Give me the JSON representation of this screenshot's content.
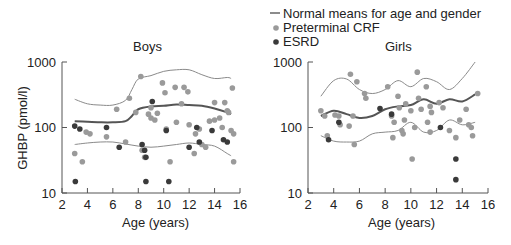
{
  "legend": {
    "items": [
      {
        "label": "Normal means for age and gender",
        "type": "line",
        "color": "#666666"
      },
      {
        "label": "Preterminal CRF",
        "type": "dot",
        "color": "#9a9a9a"
      },
      {
        "label": "ESRD",
        "type": "dot",
        "color": "#3a3a3a"
      }
    ]
  },
  "chart_data": [
    {
      "type": "scatter",
      "title": "Boys",
      "xlabel": "Age (years)",
      "ylabel": "GHBP (pmol/l)",
      "xlim": [
        2,
        16
      ],
      "ylim": [
        10,
        1000
      ],
      "yscale": "log",
      "xticks": [
        "2",
        "4",
        "6",
        "8",
        "10",
        "12",
        "14",
        "16"
      ],
      "yticks": [
        "10",
        "100",
        "1000"
      ],
      "grid": false,
      "series": [
        {
          "name": "Normal means for age and gender (mean)",
          "type": "line",
          "points": [
            [
              3,
              125
            ],
            [
              4,
              122
            ],
            [
              5,
              120
            ],
            [
              6,
              120
            ],
            [
              7,
              125
            ],
            [
              7.5,
              150
            ],
            [
              8,
              190
            ],
            [
              9,
              210
            ],
            [
              10,
              215
            ],
            [
              11,
              225
            ],
            [
              12,
              220
            ],
            [
              13,
              215
            ],
            [
              14,
              195
            ],
            [
              15,
              170
            ],
            [
              15.3,
              160
            ]
          ]
        },
        {
          "name": "Normal means for age and gender (upper)",
          "type": "line",
          "points": [
            [
              3,
              270
            ],
            [
              4,
              230
            ],
            [
              5,
              220
            ],
            [
              6,
              220
            ],
            [
              7,
              260
            ],
            [
              7.5,
              380
            ],
            [
              8,
              550
            ],
            [
              9,
              620
            ],
            [
              10,
              720
            ],
            [
              11,
              760
            ],
            [
              12,
              760
            ],
            [
              13,
              640
            ],
            [
              14,
              560
            ],
            [
              15,
              580
            ],
            [
              15.3,
              560
            ]
          ]
        },
        {
          "name": "Normal means for age and gender (lower)",
          "type": "line",
          "points": [
            [
              3,
              55
            ],
            [
              4,
              58
            ],
            [
              5,
              60
            ],
            [
              6,
              60
            ],
            [
              7,
              56
            ],
            [
              8,
              52
            ],
            [
              9,
              50
            ],
            [
              10,
              52
            ],
            [
              11,
              55
            ],
            [
              12,
              58
            ],
            [
              13,
              55
            ],
            [
              14,
              52
            ],
            [
              15,
              40
            ],
            [
              15.3,
              37
            ]
          ]
        },
        {
          "name": "Preterminal CRF",
          "type": "scatter",
          "points": [
            [
              3,
              40
            ],
            [
              3.6,
              30
            ],
            [
              3.9,
              85
            ],
            [
              4.2,
              80
            ],
            [
              5.5,
              72
            ],
            [
              6.3,
              190
            ],
            [
              7,
              60
            ],
            [
              7.3,
              280
            ],
            [
              7.8,
              170
            ],
            [
              8.2,
              600
            ],
            [
              8.3,
              45
            ],
            [
              8.5,
              35
            ],
            [
              8.8,
              160
            ],
            [
              9,
              200
            ],
            [
              9,
              140
            ],
            [
              9.3,
              130
            ],
            [
              9.5,
              165
            ],
            [
              9.9,
              480
            ],
            [
              10.1,
              340
            ],
            [
              10.2,
              95
            ],
            [
              10.5,
              30
            ],
            [
              10.9,
              410
            ],
            [
              11,
              120
            ],
            [
              11.4,
              230
            ],
            [
              11.6,
              410
            ],
            [
              11.9,
              350
            ],
            [
              12,
              110
            ],
            [
              12.4,
              40
            ],
            [
              12.5,
              80
            ],
            [
              12.8,
              95
            ],
            [
              13,
              55
            ],
            [
              13.3,
              50
            ],
            [
              13.6,
              125
            ],
            [
              14,
              240
            ],
            [
              14,
              130
            ],
            [
              14.4,
              140
            ],
            [
              14.6,
              100
            ],
            [
              14.8,
              240
            ],
            [
              15,
              180
            ],
            [
              15.1,
              170
            ],
            [
              15.3,
              90
            ],
            [
              15.4,
              400
            ],
            [
              15.5,
              80
            ],
            [
              15.5,
              30
            ]
          ]
        },
        {
          "name": "ESRD",
          "type": "scatter",
          "points": [
            [
              3,
              105
            ],
            [
              3.4,
              95
            ],
            [
              3.05,
              15
            ],
            [
              5.5,
              100
            ],
            [
              6.5,
              50
            ],
            [
              8.3,
              55
            ],
            [
              8.5,
              45
            ],
            [
              8.6,
              35
            ],
            [
              8.6,
              15
            ],
            [
              9.1,
              250
            ],
            [
              10.2,
              90
            ],
            [
              10.4,
              15
            ],
            [
              12,
              50
            ],
            [
              12.6,
              100
            ],
            [
              12.8,
              60
            ],
            [
              13.8,
              90
            ],
            [
              14.7,
              65
            ],
            [
              15,
              60
            ]
          ]
        }
      ]
    },
    {
      "type": "scatter",
      "title": "Girls",
      "xlabel": "Age (years)",
      "ylabel": "GHBP (pmol/l)",
      "xlim": [
        2,
        16
      ],
      "ylim": [
        10,
        1000
      ],
      "yscale": "log",
      "xticks": [
        "2",
        "4",
        "6",
        "8",
        "10",
        "12",
        "14",
        "16"
      ],
      "yticks": [
        "10",
        "100",
        "1000"
      ],
      "grid": false,
      "series": [
        {
          "name": "Normal means for age and gender (mean)",
          "type": "line",
          "points": [
            [
              3,
              150
            ],
            [
              4,
              180
            ],
            [
              5,
              160
            ],
            [
              6,
              140
            ],
            [
              7,
              150
            ],
            [
              8,
              190
            ],
            [
              9,
              210
            ],
            [
              10,
              220
            ],
            [
              11,
              270
            ],
            [
              12,
              230
            ],
            [
              13,
              270
            ],
            [
              14,
              250
            ],
            [
              15,
              320
            ]
          ]
        },
        {
          "name": "Normal means for age and gender (upper)",
          "type": "line",
          "points": [
            [
              3,
              300
            ],
            [
              4,
              520
            ],
            [
              5,
              550
            ],
            [
              6,
              380
            ],
            [
              7,
              330
            ],
            [
              8,
              380
            ],
            [
              9,
              520
            ],
            [
              10,
              420
            ],
            [
              11,
              560
            ],
            [
              12,
              500
            ],
            [
              13,
              380
            ],
            [
              14,
              560
            ],
            [
              15,
              1000
            ]
          ]
        },
        {
          "name": "Normal means for age and gender (lower)",
          "type": "line",
          "points": [
            [
              3,
              75
            ],
            [
              4,
              62
            ],
            [
              5,
              60
            ],
            [
              6,
              62
            ],
            [
              7,
              80
            ],
            [
              8,
              85
            ],
            [
              9,
              90
            ],
            [
              10,
              120
            ],
            [
              11,
              85
            ],
            [
              12,
              90
            ],
            [
              13,
              130
            ],
            [
              14,
              110
            ],
            [
              15,
              120
            ]
          ]
        },
        {
          "name": "Preterminal CRF",
          "type": "scatter",
          "points": [
            [
              3,
              180
            ],
            [
              3.3,
              150
            ],
            [
              3.5,
              75
            ],
            [
              4.1,
              155
            ],
            [
              4.4,
              150
            ],
            [
              4.5,
              110
            ],
            [
              5.2,
              105
            ],
            [
              5.3,
              650
            ],
            [
              5.5,
              150
            ],
            [
              5.6,
              55
            ],
            [
              5.8,
              500
            ],
            [
              6.4,
              330
            ],
            [
              6.5,
              280
            ],
            [
              8.2,
              420
            ],
            [
              8.5,
              150
            ],
            [
              8.6,
              70
            ],
            [
              8.7,
              120
            ],
            [
              9,
              300
            ],
            [
              9.1,
              200
            ],
            [
              9.3,
              90
            ],
            [
              9.4,
              80
            ],
            [
              9.5,
              130
            ],
            [
              9.6,
              230
            ],
            [
              10,
              180
            ],
            [
              10.1,
              33
            ],
            [
              10.3,
              100
            ],
            [
              10.5,
              700
            ],
            [
              10.6,
              280
            ],
            [
              10.8,
              190
            ],
            [
              11.2,
              420
            ],
            [
              11.3,
              120
            ],
            [
              11.5,
              210
            ],
            [
              11.5,
              85
            ],
            [
              11.6,
              170
            ],
            [
              12.2,
              240
            ],
            [
              12.5,
              200
            ],
            [
              13,
              90
            ],
            [
              13.5,
              70
            ],
            [
              13.8,
              130
            ],
            [
              14.3,
              190
            ],
            [
              14.5,
              110
            ],
            [
              14.7,
              100
            ],
            [
              14.8,
              75
            ],
            [
              15.2,
              330
            ]
          ]
        },
        {
          "name": "ESRD",
          "type": "scatter",
          "points": [
            [
              3.6,
              65
            ],
            [
              4.4,
              120
            ],
            [
              7.6,
              195
            ],
            [
              8.5,
              160
            ],
            [
              12.3,
              100
            ],
            [
              13.5,
              33
            ],
            [
              13.5,
              16
            ]
          ]
        }
      ]
    }
  ]
}
